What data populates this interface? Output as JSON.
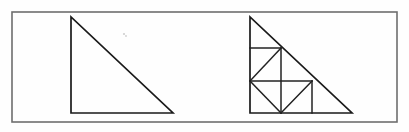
{
  "figure": {
    "background_color": "#fefefe",
    "frame": {
      "name": "outer-border",
      "x": 12,
      "y": 12,
      "width": 385,
      "height": 110,
      "stroke_color": "#6e6e6e",
      "stroke_width": 1.6
    },
    "stroke_color": "#1a1a1a",
    "stroke_width": 1.7,
    "shapes": [
      {
        "id": "plain-triangle",
        "label": "Plain right triangle",
        "type": "polygon",
        "points": "71,17 71,113 173,113",
        "legs": {
          "vertical": 96,
          "horizontal": 102
        },
        "right_angle_at": "bottom-left"
      },
      {
        "id": "dissected-triangle",
        "label": "Dissected right triangle",
        "type": "polygon",
        "points": "250,17 250,113 352,113",
        "legs": {
          "vertical": 96,
          "horizontal": 102
        },
        "right_angle_at": "bottom-left"
      }
    ],
    "dissection_lines": [
      {
        "id": "upper-horizontal",
        "x1": 250,
        "y1": 48,
        "x2": 281,
        "y2": 48
      },
      {
        "id": "middle-horizontal",
        "x1": 250,
        "y1": 81,
        "x2": 312,
        "y2": 81
      },
      {
        "id": "left-vertical",
        "x1": 281,
        "y1": 48,
        "x2": 281,
        "y2": 113
      },
      {
        "id": "right-vertical",
        "x1": 312,
        "y1": 81,
        "x2": 312,
        "y2": 113
      },
      {
        "id": "upper-square-diagonal",
        "x1": 250,
        "y1": 81,
        "x2": 281,
        "y2": 48
      },
      {
        "id": "lower-left-diagonal",
        "x1": 250,
        "y1": 81,
        "x2": 281,
        "y2": 113
      },
      {
        "id": "lower-right-diagonal",
        "x1": 281,
        "y1": 113,
        "x2": 312,
        "y2": 81
      }
    ],
    "specks": [
      {
        "id": "speck-left",
        "cx": 124,
        "cy": 34,
        "r": 1.1
      },
      {
        "id": "speck-right",
        "cx": 126,
        "cy": 36,
        "r": 0.9
      }
    ]
  }
}
